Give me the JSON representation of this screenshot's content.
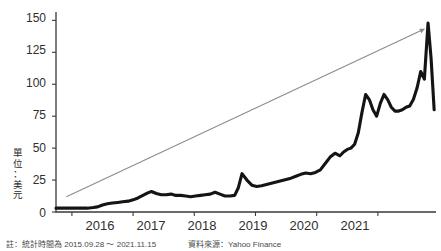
{
  "axis_label_vertical": "單\n位\n：\n美\n元",
  "footnote": {
    "period": "註：統計時間為 2015.09.28 ～ 2021.11.15",
    "source": "資料來源：Yahoo Finance"
  },
  "colors": {
    "line": "#141414",
    "axis": "#3a3a3a",
    "trend_arrow": "#8c8c8c",
    "text": "#2f2f2f",
    "background": "#ffffff"
  },
  "chart_data": {
    "type": "line",
    "title": "",
    "xlabel": "",
    "ylabel": "單位：美元",
    "ylim": [
      0,
      155
    ],
    "xlim": [
      2015.74,
      2021.95
    ],
    "grid": false,
    "legend": null,
    "ytick_labels": [
      "0",
      "25",
      "50",
      "75",
      "100",
      "125",
      "150"
    ],
    "ytick_values": [
      0,
      25,
      50,
      75,
      100,
      125,
      150
    ],
    "xtick_labels": [
      "2016",
      "2017",
      "2018",
      "2019",
      "2020",
      "2021"
    ],
    "xtick_values": [
      2016,
      2017,
      2018,
      2019,
      2020,
      2021
    ],
    "series": [
      {
        "name": "price",
        "x": [
          2015.74,
          2015.85,
          2015.95,
          2016.05,
          2016.15,
          2016.25,
          2016.35,
          2016.42,
          2016.5,
          2016.58,
          2016.66,
          2016.75,
          2016.83,
          2016.92,
          2017.0,
          2017.08,
          2017.16,
          2017.24,
          2017.3,
          2017.38,
          2017.46,
          2017.54,
          2017.62,
          2017.7,
          2017.78,
          2017.86,
          2017.94,
          2018.02,
          2018.1,
          2018.18,
          2018.26,
          2018.34,
          2018.42,
          2018.5,
          2018.58,
          2018.66,
          2018.72,
          2018.78,
          2018.86,
          2018.94,
          2019.02,
          2019.1,
          2019.18,
          2019.26,
          2019.34,
          2019.42,
          2019.5,
          2019.58,
          2019.66,
          2019.74,
          2019.82,
          2019.9,
          2019.98,
          2020.06,
          2020.14,
          2020.22,
          2020.3,
          2020.38,
          2020.44,
          2020.5,
          2020.56,
          2020.62,
          2020.68,
          2020.74,
          2020.8,
          2020.86,
          2020.92,
          2020.98,
          2021.04,
          2021.1,
          2021.16,
          2021.22,
          2021.28,
          2021.34,
          2021.4,
          2021.46,
          2021.52,
          2021.58,
          2021.64,
          2021.7,
          2021.76,
          2021.82,
          2021.87,
          2021.92
        ],
        "y": [
          3,
          3,
          3,
          3,
          3,
          3,
          3.5,
          4,
          5.5,
          6.5,
          7,
          7.5,
          8,
          8.5,
          9.5,
          11,
          13,
          15,
          16,
          14.5,
          13.5,
          13.5,
          14,
          13,
          13,
          12.5,
          12,
          12.5,
          13,
          13.5,
          14,
          15.5,
          14,
          12.5,
          12.5,
          13,
          19,
          30,
          25,
          21,
          20,
          20.5,
          21.5,
          22.5,
          23.5,
          24.5,
          25.5,
          26.5,
          28,
          29.5,
          30.5,
          30,
          31,
          33,
          38,
          43,
          46,
          44,
          47,
          49,
          50,
          53,
          62,
          78,
          92,
          88,
          80,
          75,
          85,
          92,
          88,
          82,
          79,
          79,
          80,
          82,
          83,
          88,
          97,
          110,
          104,
          148,
          120,
          80
        ]
      }
    ],
    "annotations": [
      {
        "type": "arrow",
        "label": "growth-trend-arrow",
        "from_x": 2015.91,
        "from_y": 12,
        "to_x": 2021.75,
        "to_y": 143
      }
    ]
  }
}
